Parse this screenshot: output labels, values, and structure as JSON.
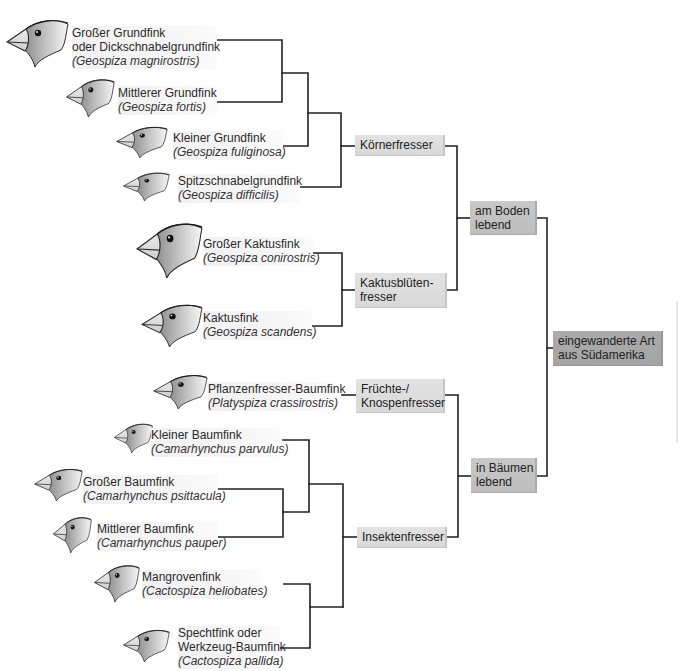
{
  "species": [
    {
      "name": [
        "Großer Grundfink",
        "oder Dickschnabelgrundfink"
      ],
      "latin": "(Geospiza magnirostris)",
      "icon": "finch-head-icon"
    },
    {
      "name": [
        "Mittlerer Grundfink"
      ],
      "latin": "(Geospiza fortis)",
      "icon": "finch-head-icon"
    },
    {
      "name": [
        "Kleiner Grundfink"
      ],
      "latin": "(Geospiza fuliginosa)",
      "icon": "finch-head-icon"
    },
    {
      "name": [
        "Spitzschnabelgrundfink"
      ],
      "latin": "(Geospiza difficilis)",
      "icon": "finch-head-icon"
    },
    {
      "name": [
        "Großer Kaktusfink"
      ],
      "latin": "(Geospiza conirostris)",
      "icon": "finch-head-icon"
    },
    {
      "name": [
        "Kaktusfink"
      ],
      "latin": "(Geospiza scandens)",
      "icon": "finch-head-icon"
    },
    {
      "name": [
        "Pflanzenfresser-Baumfink"
      ],
      "latin": "(Platyspiza crassirostris)",
      "icon": "finch-head-icon"
    },
    {
      "name": [
        "Kleiner Baumfink"
      ],
      "latin": "(Camarhynchus parvulus)",
      "icon": "finch-head-icon"
    },
    {
      "name": [
        "Großer Baumfink"
      ],
      "latin": "(Camarhynchus psittacula)",
      "icon": "finch-head-icon"
    },
    {
      "name": [
        "Mittlerer Baumfink"
      ],
      "latin": "(Camarhynchus pauper)",
      "icon": "finch-head-icon"
    },
    {
      "name": [
        "Mangrovenfink"
      ],
      "latin": "(Cactospiza heliobates)",
      "icon": "finch-head-icon"
    },
    {
      "name": [
        "Spechtfink oder",
        "Werkzeug-Baumfink"
      ],
      "latin": "(Cactospiza pallida)",
      "icon": "finch-head-icon"
    }
  ],
  "diet_groups": [
    {
      "lines": [
        "Körnerfresser"
      ],
      "members": [
        0,
        1,
        2,
        3
      ]
    },
    {
      "lines": [
        "Kaktusblüten-",
        "fresser"
      ],
      "members": [
        4,
        5
      ]
    },
    {
      "lines": [
        "Früchte-/",
        "Knospenfresser"
      ],
      "members": [
        6
      ]
    },
    {
      "lines": [
        "Insektenfresser"
      ],
      "members": [
        7,
        8,
        9,
        10,
        11
      ]
    }
  ],
  "habitat_groups": [
    {
      "lines": [
        "am Boden",
        "lebend"
      ],
      "members": [
        0,
        1
      ]
    },
    {
      "lines": [
        "in Bäumen",
        "lebend"
      ],
      "members": [
        2,
        3
      ]
    }
  ],
  "root": {
    "lines": [
      "eingewanderte Art",
      "aus Südamerika"
    ]
  },
  "colors": {
    "line": "#222222",
    "diet_box": "#dcdcdc",
    "habitat_box": "#c2c2c2",
    "root_box": "#a8a8a8",
    "label_bg": "#f2f2f2"
  }
}
